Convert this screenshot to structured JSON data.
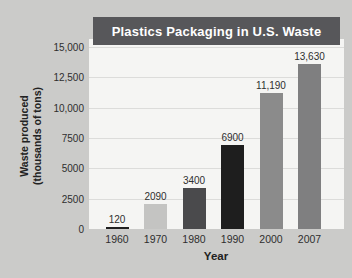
{
  "chart_data": {
    "type": "bar",
    "title": "Plastics Packaging in U.S. Waste",
    "xlabel": "Year",
    "ylabel_line1": "Waste produced",
    "ylabel_line2": "(thousands of tons)",
    "categories": [
      "1960",
      "1970",
      "1980",
      "1990",
      "2000",
      "2007"
    ],
    "values": [
      120,
      2090,
      3400,
      6900,
      11190,
      13630
    ],
    "value_labels": [
      "120",
      "2090",
      "3400",
      "6900",
      "11,190",
      "13,630"
    ],
    "bar_colors": [
      "#1f1f1f",
      "#c4c4c2",
      "#4a4a4c",
      "#1e1e1e",
      "#8b8b8b",
      "#7f7f80"
    ],
    "ylim": [
      0,
      15000
    ],
    "ytick_values": [
      0,
      2500,
      5000,
      7500,
      10000,
      12500,
      15000
    ],
    "ytick_labels": [
      "0",
      "2500",
      "5000",
      "7500",
      "10,000",
      "12,500",
      "15,000"
    ],
    "grid": true,
    "legend": "none"
  },
  "colors": {
    "page_background": "#cbcbc9",
    "plot_background": "#f5f5f3",
    "title_band_background": "#57575a",
    "title_text": "#ffffff",
    "gridline": "#dcdcda",
    "tick_text": "#2e2e2e"
  }
}
